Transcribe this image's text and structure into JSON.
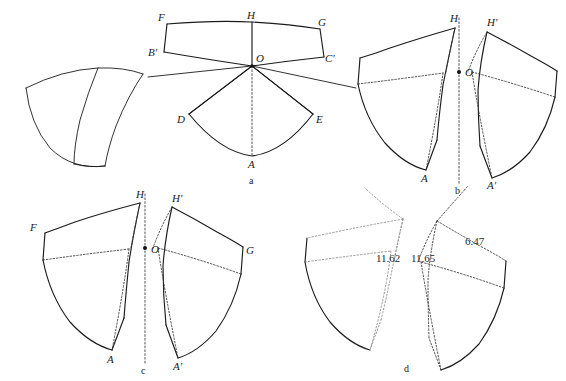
{
  "figure": {
    "caption_panels": [
      "a",
      "b",
      "c",
      "d"
    ]
  },
  "panels": {
    "a": {
      "label": "a",
      "vertex_labels": [
        "F",
        "H",
        "G",
        "B'",
        "O",
        "C'",
        "D",
        "E",
        "A"
      ],
      "points": {
        "F": "F",
        "H": "H",
        "G": "G",
        "Bp": "B'",
        "O": "O",
        "Cp": "C'",
        "D": "D",
        "E": "E",
        "A": "A"
      }
    },
    "b": {
      "label": "b",
      "vertex_labels": [
        "H",
        "H'",
        "O",
        "A",
        "A'"
      ],
      "points": {
        "H": "H",
        "Hp": "H'",
        "O": "O",
        "A": "A",
        "Ap": "A'"
      }
    },
    "c": {
      "label": "c",
      "vertex_labels": [
        "F",
        "H",
        "H'",
        "O",
        "G",
        "A",
        "A'"
      ],
      "points": {
        "F": "F",
        "H": "H",
        "Hp": "H'",
        "O": "O",
        "G": "G",
        "A": "A",
        "Ap": "A'"
      }
    },
    "d": {
      "label": "d",
      "dimensions": [
        "11.62",
        "11.65",
        "6.47"
      ],
      "dim_left": "11.62",
      "dim_mid": "11.65",
      "dim_right": "6.47"
    }
  },
  "shell_3d": {
    "name": "curved-shell-solid"
  },
  "colors": {
    "stroke_solid": "#1b1b1b",
    "stroke_dotted": "#3a3a3a",
    "stroke_dotted_light": "#8d8d8d",
    "background": "#ffffff",
    "text": "#1a1a1a"
  }
}
